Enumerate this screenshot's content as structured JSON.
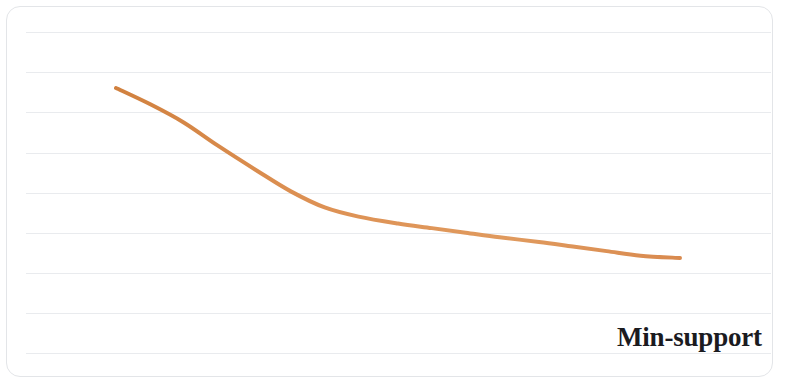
{
  "figure": {
    "background_color": "#ffffff",
    "frame_color": "#e3e5e8",
    "gridline_color": "#e9ebee",
    "axis_label": "Min-support"
  },
  "chart_data": {
    "type": "line",
    "title": "",
    "subtitle": "",
    "xlabel": "Min-support",
    "ylabel": "",
    "grid": true,
    "grid_axis": "y",
    "legend": false,
    "legend_position": "none",
    "annotations": [],
    "xlim": [
      0,
      100
    ],
    "ylim": [
      0,
      100
    ],
    "xticklabels": [],
    "yticklabels": [],
    "gridline_count": 9,
    "series": [
      {
        "name": "Runtime",
        "color": "#d98a4f",
        "line_width": 4,
        "marker": "none",
        "x": [
          0,
          6,
          12,
          18,
          25,
          31,
          37,
          43,
          50,
          56,
          62,
          68,
          75,
          81,
          87,
          93,
          100
        ],
        "y": [
          100,
          93,
          85,
          75,
          64,
          55,
          48,
          44,
          41,
          39,
          37,
          35,
          33,
          31,
          29,
          27,
          26
        ]
      }
    ]
  }
}
